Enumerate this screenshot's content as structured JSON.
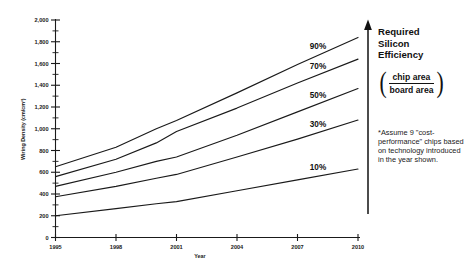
{
  "chart_data": {
    "type": "line",
    "title": "Required Silicon Efficiency",
    "xlabel": "Year",
    "ylabel": "Wiring Density (cm/cm²)",
    "xlim": [
      1995,
      2010
    ],
    "ylim": [
      0,
      2000
    ],
    "grid": false,
    "legend_position": "inline-right-of-curves",
    "x_ticks": [
      "1995",
      "1998",
      "2001",
      "2004",
      "2007",
      "2010"
    ],
    "x_tick_values": [
      1995,
      1998,
      2001,
      2004,
      2007,
      2010
    ],
    "y_ticks": [
      "0",
      "200",
      "400",
      "600",
      "800",
      "1,000",
      "1,200",
      "1,400",
      "1,600",
      "1,800",
      "2,000"
    ],
    "y_tick_values": [
      0,
      200,
      400,
      600,
      800,
      1000,
      1200,
      1400,
      1600,
      1800,
      2000
    ],
    "y_minor_step": 100,
    "x": [
      1995,
      1998,
      2000,
      2001,
      2004,
      2007,
      2010
    ],
    "series": [
      {
        "name": "90%",
        "values": [
          650,
          830,
          1000,
          1075,
          1330,
          1590,
          1840
        ],
        "label": "90%"
      },
      {
        "name": "70%",
        "values": [
          560,
          720,
          870,
          975,
          1190,
          1420,
          1640
        ],
        "label": "70%"
      },
      {
        "name": "50%",
        "values": [
          470,
          600,
          700,
          740,
          940,
          1155,
          1370
        ],
        "label": "50%"
      },
      {
        "name": "30%",
        "values": [
          375,
          470,
          545,
          580,
          740,
          905,
          1080
        ],
        "label": "30%"
      },
      {
        "name": "10%",
        "values": [
          200,
          265,
          310,
          330,
          430,
          530,
          630
        ],
        "label": "10%"
      }
    ],
    "annotations": [
      {
        "text": "Required Silicon Efficiency",
        "role": "panel-title"
      },
      {
        "text": "chip area / board area",
        "role": "fraction"
      },
      {
        "text": "*Assume 9 \"cost-performance\" chips based on technology introduced in the year shown.",
        "role": "footnote"
      }
    ]
  },
  "panel": {
    "title_line1": "Required",
    "title_line2": "Silicon",
    "title_line3": "Efficiency",
    "fraction_numerator": "chip area",
    "fraction_denominator": "board area",
    "paren_left": "(",
    "paren_right": ")",
    "footnote": "*Assume 9 \"cost-performance\" chips based on technology introduced in the year shown."
  },
  "colors": {
    "ink": "#1a1a1a",
    "background": "#ffffff"
  }
}
